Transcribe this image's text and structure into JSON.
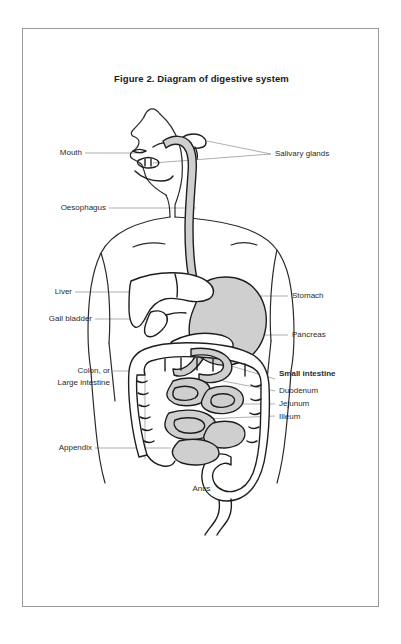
{
  "figure": {
    "title": "Figure 2. Diagram of digestive system",
    "border_color": "#9a9a9a",
    "organ_fill_color": "#cfcfcf",
    "outline_color": "#1e1e1e",
    "leader_line_color": "#8d8d8d",
    "background_color": "#ffffff"
  },
  "labels": {
    "left": [
      {
        "id": "mouth",
        "text": "Mouth"
      },
      {
        "id": "oesophagus",
        "text": "Oesophagus"
      },
      {
        "id": "liver",
        "text": "Liver"
      },
      {
        "id": "gall-bladder",
        "text": "Gall bladder"
      },
      {
        "id": "colon-line1",
        "text": "Colon, or"
      },
      {
        "id": "colon-line2",
        "text": "Large intestine"
      },
      {
        "id": "appendix",
        "text": "Appendix"
      }
    ],
    "right": [
      {
        "id": "salivary-glands",
        "text": "Salivary glands"
      },
      {
        "id": "stomach",
        "text": "Stomach"
      },
      {
        "id": "pancreas",
        "text": "Pancreas"
      },
      {
        "id": "small-intestine",
        "text": "Small intestine",
        "bold": true
      },
      {
        "id": "duodenum",
        "text": "Duodenum"
      },
      {
        "id": "jejunum",
        "text": "Jejunum"
      },
      {
        "id": "illeum",
        "text": "Illeum"
      }
    ],
    "center": [
      {
        "id": "anus",
        "text": "Anus"
      }
    ]
  }
}
